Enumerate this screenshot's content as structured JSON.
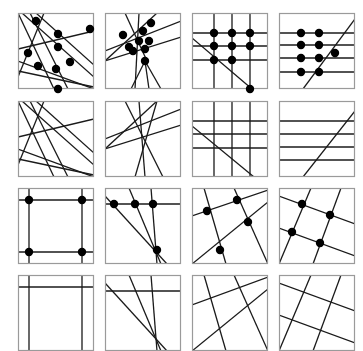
{
  "figure": {
    "rows": 4,
    "cols": 4,
    "panel_size": 76,
    "col_x": [
      18,
      105,
      192,
      279
    ],
    "row_y": [
      13,
      101,
      188,
      275
    ],
    "colors": {
      "border": "#9a9a9a",
      "line": "#1a1a1a",
      "point": "#000000"
    },
    "point_radius": 4.2,
    "panels": [
      {
        "id": "r1c1",
        "lines": [
          [
            4,
            0,
            76,
            64
          ],
          [
            18,
            0,
            76,
            52
          ],
          [
            0,
            36,
            76,
            18
          ],
          [
            0,
            0,
            36,
            76
          ],
          [
            12,
            0,
            50,
            76
          ],
          [
            0,
            58,
            76,
            74
          ],
          [
            0,
            64,
            26,
            0
          ],
          [
            0,
            48,
            76,
            76
          ]
        ],
        "points": [
          [
            18,
            8
          ],
          [
            40,
            21
          ],
          [
            72,
            16
          ],
          [
            10,
            40
          ],
          [
            40,
            34
          ],
          [
            52,
            49
          ],
          [
            20,
            53
          ],
          [
            38,
            56
          ],
          [
            40,
            76
          ]
        ]
      },
      {
        "id": "r1c2",
        "lines": [
          [
            0,
            38,
            76,
            8
          ],
          [
            0,
            48,
            76,
            24
          ],
          [
            0,
            48,
            52,
            0
          ],
          [
            20,
            0,
            42,
            48
          ],
          [
            34,
            0,
            30,
            76
          ],
          [
            40,
            48,
            56,
            76
          ],
          [
            40,
            48,
            44,
            76
          ],
          [
            40,
            48,
            26,
            76
          ]
        ],
        "points": [
          [
            18,
            22
          ],
          [
            24,
            34
          ],
          [
            34,
            28
          ],
          [
            38,
            18
          ],
          [
            46,
            10
          ],
          [
            44,
            28
          ],
          [
            40,
            36
          ],
          [
            28,
            38
          ],
          [
            40,
            48
          ]
        ]
      },
      {
        "id": "r1c3",
        "lines": [
          [
            0,
            20,
            76,
            20
          ],
          [
            0,
            33,
            76,
            33
          ],
          [
            0,
            47,
            76,
            47
          ],
          [
            22,
            0,
            22,
            76
          ],
          [
            40,
            0,
            40,
            76
          ],
          [
            58,
            0,
            58,
            76
          ],
          [
            0,
            25,
            60,
            76
          ]
        ],
        "points": [
          [
            22,
            20
          ],
          [
            40,
            20
          ],
          [
            58,
            20
          ],
          [
            22,
            33
          ],
          [
            40,
            33
          ],
          [
            58,
            33
          ],
          [
            22,
            47
          ],
          [
            40,
            47
          ],
          [
            58,
            76
          ]
        ]
      },
      {
        "id": "r1c4",
        "lines": [
          [
            0,
            20,
            76,
            20
          ],
          [
            0,
            32,
            76,
            32
          ],
          [
            0,
            45,
            76,
            45
          ],
          [
            0,
            59,
            76,
            59
          ],
          [
            24,
            76,
            76,
            6
          ]
        ],
        "points": [
          [
            22,
            20
          ],
          [
            40,
            20
          ],
          [
            22,
            32
          ],
          [
            40,
            32
          ],
          [
            22,
            45
          ],
          [
            40,
            45
          ],
          [
            56,
            40
          ],
          [
            22,
            59
          ],
          [
            40,
            59
          ]
        ]
      },
      {
        "id": "r2c1",
        "lines": [
          [
            4,
            0,
            76,
            64
          ],
          [
            18,
            0,
            76,
            52
          ],
          [
            0,
            36,
            76,
            18
          ],
          [
            0,
            0,
            36,
            76
          ],
          [
            12,
            0,
            50,
            76
          ],
          [
            0,
            58,
            76,
            74
          ],
          [
            0,
            64,
            26,
            0
          ],
          [
            0,
            48,
            76,
            76
          ]
        ],
        "points": []
      },
      {
        "id": "r2c2",
        "lines": [
          [
            0,
            38,
            76,
            8
          ],
          [
            0,
            48,
            76,
            24
          ],
          [
            0,
            48,
            52,
            0
          ],
          [
            20,
            0,
            58,
            76
          ],
          [
            34,
            0,
            40,
            76
          ],
          [
            52,
            0,
            30,
            76
          ]
        ],
        "points": []
      },
      {
        "id": "r2c3",
        "lines": [
          [
            0,
            20,
            76,
            20
          ],
          [
            0,
            33,
            76,
            33
          ],
          [
            0,
            47,
            76,
            47
          ],
          [
            22,
            0,
            22,
            76
          ],
          [
            40,
            0,
            40,
            76
          ],
          [
            58,
            0,
            58,
            76
          ],
          [
            0,
            25,
            62,
            76
          ]
        ],
        "points": []
      },
      {
        "id": "r2c4",
        "lines": [
          [
            0,
            20,
            76,
            20
          ],
          [
            0,
            33,
            76,
            33
          ],
          [
            0,
            46,
            76,
            46
          ],
          [
            0,
            59,
            76,
            59
          ],
          [
            24,
            76,
            76,
            10
          ]
        ],
        "points": []
      },
      {
        "id": "r3c1",
        "lines": [
          [
            0,
            12,
            76,
            12
          ],
          [
            0,
            64,
            76,
            64
          ],
          [
            11,
            0,
            11,
            76
          ],
          [
            64,
            0,
            64,
            76
          ]
        ],
        "points": [
          [
            11,
            12
          ],
          [
            64,
            12
          ],
          [
            11,
            64
          ],
          [
            64,
            64
          ]
        ]
      },
      {
        "id": "r3c2",
        "lines": [
          [
            0,
            16,
            76,
            16
          ],
          [
            0,
            8,
            62,
            76
          ],
          [
            24,
            0,
            56,
            76
          ],
          [
            46,
            0,
            52,
            76
          ]
        ],
        "points": [
          [
            9,
            16
          ],
          [
            30,
            16
          ],
          [
            48,
            16
          ],
          [
            52,
            62
          ]
        ]
      },
      {
        "id": "r3c3",
        "lines": [
          [
            0,
            28,
            76,
            2
          ],
          [
            0,
            76,
            76,
            14
          ],
          [
            12,
            0,
            34,
            76
          ],
          [
            42,
            0,
            76,
            76
          ]
        ],
        "points": [
          [
            15,
            23
          ],
          [
            45,
            12
          ],
          [
            56,
            34
          ],
          [
            28,
            62
          ]
        ]
      },
      {
        "id": "r3c4",
        "lines": [
          [
            0,
            8,
            76,
            36
          ],
          [
            0,
            40,
            76,
            68
          ],
          [
            32,
            0,
            0,
            76
          ],
          [
            62,
            0,
            34,
            76
          ]
        ],
        "points": [
          [
            23,
            16
          ],
          [
            51,
            27
          ],
          [
            13,
            44
          ],
          [
            41,
            55
          ]
        ]
      },
      {
        "id": "r4c1",
        "lines": [
          [
            0,
            12,
            76,
            12
          ],
          [
            11,
            0,
            11,
            76
          ],
          [
            64,
            0,
            64,
            76
          ]
        ],
        "points": []
      },
      {
        "id": "r4c2",
        "lines": [
          [
            0,
            16,
            76,
            16
          ],
          [
            0,
            8,
            62,
            76
          ],
          [
            24,
            0,
            56,
            76
          ],
          [
            46,
            0,
            52,
            76
          ]
        ],
        "points": []
      },
      {
        "id": "r4c3",
        "lines": [
          [
            0,
            30,
            76,
            2
          ],
          [
            0,
            76,
            76,
            14
          ],
          [
            12,
            0,
            34,
            76
          ],
          [
            42,
            0,
            76,
            76
          ]
        ],
        "points": []
      },
      {
        "id": "r4c4",
        "lines": [
          [
            0,
            8,
            76,
            36
          ],
          [
            0,
            40,
            76,
            68
          ],
          [
            32,
            0,
            0,
            76
          ],
          [
            62,
            0,
            34,
            76
          ]
        ],
        "points": []
      }
    ]
  }
}
